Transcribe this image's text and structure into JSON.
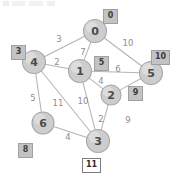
{
  "figure": {
    "kind": "weighted-undirected-graph",
    "accent_node_fill": "#cdcdcd",
    "accent_node_stroke": "#a8a8a8",
    "edge_color": "#b4b4b4",
    "label_box_fill": "#c3c3c3",
    "active_label_box_fill": "#ffffff"
  },
  "nodes": [
    {
      "id": "0",
      "label": "0",
      "x": 95,
      "y": 31,
      "r": 11.5,
      "dist": "0",
      "dist_x": 103,
      "dist_y": 9,
      "active": false
    },
    {
      "id": "1",
      "label": "1",
      "x": 80,
      "y": 71,
      "r": 11.5,
      "dist": "5",
      "dist_x": 94,
      "dist_y": 56,
      "active": false
    },
    {
      "id": "2",
      "label": "2",
      "x": 111,
      "y": 95,
      "r": 10.0,
      "dist": "9",
      "dist_x": 128,
      "dist_y": 86,
      "active": false
    },
    {
      "id": "3",
      "label": "3",
      "x": 98,
      "y": 141,
      "r": 11.5,
      "dist": "11",
      "dist_x": 82,
      "dist_y": 158,
      "active": true
    },
    {
      "id": "4",
      "label": "4",
      "x": 34,
      "y": 62,
      "r": 11.5,
      "dist": "3",
      "dist_x": 11,
      "dist_y": 45,
      "active": false
    },
    {
      "id": "5",
      "label": "5",
      "x": 151,
      "y": 73,
      "r": 11.5,
      "dist": "10",
      "dist_x": 151,
      "dist_y": 50,
      "active": false
    },
    {
      "id": "6",
      "label": "6",
      "x": 43,
      "y": 123,
      "r": 11.0,
      "dist": "8",
      "dist_x": 18,
      "dist_y": 143,
      "active": false
    }
  ],
  "edges": [
    {
      "from": "0",
      "to": "4",
      "weight": "3",
      "wx": 59,
      "wy": 39
    },
    {
      "from": "0",
      "to": "1",
      "weight": "7",
      "wx": 83,
      "wy": 52
    },
    {
      "from": "0",
      "to": "5",
      "weight": "10",
      "wx": 128,
      "wy": 43
    },
    {
      "from": "1",
      "to": "4",
      "weight": "2",
      "wx": 57,
      "wy": 62
    },
    {
      "from": "1",
      "to": "5",
      "weight": "6",
      "wx": 118,
      "wy": 69
    },
    {
      "from": "1",
      "to": "2",
      "weight": "4",
      "wx": 101,
      "wy": 81
    },
    {
      "from": "1",
      "to": "3",
      "weight": "10",
      "wx": 83,
      "wy": 101
    },
    {
      "from": "2",
      "to": "3",
      "weight": "2",
      "wx": 101,
      "wy": 119
    },
    {
      "from": "2",
      "to": "5",
      "weight": "9",
      "wx": 128,
      "wy": 120
    },
    {
      "from": "4",
      "to": "6",
      "weight": "5",
      "wx": 33,
      "wy": 98
    },
    {
      "from": "4",
      "to": "3",
      "weight": "11",
      "wx": 58,
      "wy": 103
    },
    {
      "from": "6",
      "to": "3",
      "weight": "4",
      "wx": 68,
      "wy": 137
    }
  ],
  "chart_data": {
    "type": "graph",
    "title": "",
    "node_ids": [
      "0",
      "1",
      "2",
      "3",
      "4",
      "5",
      "6"
    ],
    "node_distances": {
      "0": "0",
      "1": "5",
      "2": "9",
      "3": "11",
      "4": "3",
      "5": "10",
      "6": "8"
    },
    "active_node": "3",
    "edge_list": [
      [
        "0",
        "4",
        3
      ],
      [
        "0",
        "1",
        7
      ],
      [
        "0",
        "5",
        10
      ],
      [
        "1",
        "4",
        2
      ],
      [
        "1",
        "5",
        6
      ],
      [
        "1",
        "2",
        4
      ],
      [
        "1",
        "3",
        10
      ],
      [
        "2",
        "3",
        2
      ],
      [
        "2",
        "5",
        9
      ],
      [
        "4",
        "6",
        5
      ],
      [
        "4",
        "3",
        11
      ],
      [
        "6",
        "3",
        4
      ]
    ]
  }
}
